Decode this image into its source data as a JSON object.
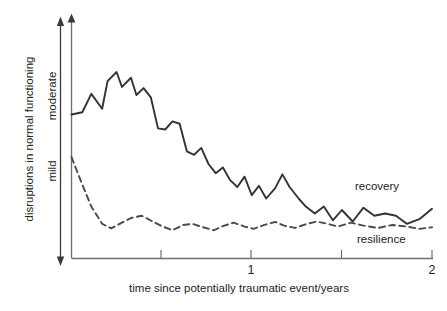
{
  "chart_data": {
    "type": "line",
    "title": "",
    "xlabel": "time since potentially traumatic event/years",
    "ylabel": "disruptions in normal functioning",
    "xlim": [
      0,
      2
    ],
    "ylim": [
      0,
      1
    ],
    "grid": false,
    "legend_position": "inline-right",
    "x_ticks": [
      0.5,
      1,
      1.5,
      2
    ],
    "x_tick_labels": [
      "",
      "1",
      "",
      "2"
    ],
    "y_category_labels": [
      "moderate",
      "mild"
    ],
    "y_axis_direction_hint": "increasing upward",
    "series": [
      {
        "name": "recovery",
        "style": "solid",
        "color": "#333333",
        "x": [
          0.0,
          0.06,
          0.11,
          0.17,
          0.2,
          0.25,
          0.28,
          0.33,
          0.36,
          0.4,
          0.44,
          0.48,
          0.52,
          0.56,
          0.6,
          0.64,
          0.68,
          0.72,
          0.76,
          0.8,
          0.84,
          0.88,
          0.92,
          0.96,
          1.0,
          1.04,
          1.08,
          1.13,
          1.17,
          1.21,
          1.26,
          1.3,
          1.35,
          1.4,
          1.45,
          1.5,
          1.56,
          1.62,
          1.68,
          1.74,
          1.8,
          1.86,
          1.93,
          2.0
        ],
        "y": [
          0.615,
          0.625,
          0.705,
          0.64,
          0.76,
          0.8,
          0.735,
          0.775,
          0.7,
          0.73,
          0.69,
          0.555,
          0.55,
          0.585,
          0.575,
          0.455,
          0.44,
          0.47,
          0.4,
          0.36,
          0.385,
          0.33,
          0.3,
          0.345,
          0.265,
          0.305,
          0.25,
          0.295,
          0.355,
          0.3,
          0.25,
          0.215,
          0.185,
          0.215,
          0.155,
          0.2,
          0.15,
          0.21,
          0.175,
          0.185,
          0.175,
          0.14,
          0.16,
          0.205
        ]
      },
      {
        "name": "resilience",
        "style": "dashed",
        "color": "#4a4a4a",
        "x": [
          0.0,
          0.05,
          0.11,
          0.17,
          0.22,
          0.28,
          0.33,
          0.39,
          0.45,
          0.5,
          0.56,
          0.62,
          0.67,
          0.73,
          0.79,
          0.84,
          0.9,
          0.96,
          1.01,
          1.07,
          1.13,
          1.18,
          1.24,
          1.3,
          1.36,
          1.42,
          1.48,
          1.55,
          1.62,
          1.7,
          1.78,
          1.86,
          1.93,
          2.0
        ],
        "y": [
          0.43,
          0.33,
          0.215,
          0.14,
          0.12,
          0.145,
          0.165,
          0.175,
          0.15,
          0.13,
          0.112,
          0.135,
          0.14,
          0.125,
          0.112,
          0.13,
          0.145,
          0.128,
          0.118,
          0.135,
          0.148,
          0.132,
          0.122,
          0.138,
          0.15,
          0.14,
          0.128,
          0.145,
          0.132,
          0.122,
          0.135,
          0.128,
          0.118,
          0.125
        ]
      }
    ],
    "annotations": [
      {
        "text": "recovery",
        "x": 1.55,
        "y": 0.265
      },
      {
        "text": "resilience",
        "x": 1.62,
        "y": 0.04
      }
    ]
  }
}
